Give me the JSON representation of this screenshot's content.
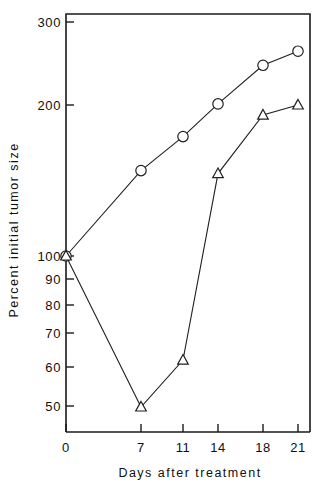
{
  "chart_data": {
    "type": "line",
    "title": "",
    "xlabel": "Days after treatment",
    "ylabel": "Percent initial tumor size",
    "yscale": "log",
    "ylim": [
      45,
      320
    ],
    "xlim": [
      0,
      22.5
    ],
    "grid": false,
    "legend": "none",
    "x": [
      0,
      7,
      11,
      14,
      18,
      21
    ],
    "xtick_labels": [
      "0",
      "7",
      "11",
      "14",
      "18",
      "21"
    ],
    "ytick_labels": [
      "50",
      "60",
      "70",
      "80",
      "90",
      "100",
      "200",
      "300"
    ],
    "ytick_values": [
      50,
      60,
      70,
      80,
      90,
      100,
      200,
      300
    ],
    "series": [
      {
        "name": "open-circle-series",
        "marker": "circle",
        "values": [
          100,
          148,
          173,
          201,
          240,
          256
        ]
      },
      {
        "name": "open-triangle-series",
        "marker": "triangle",
        "values": [
          100,
          50,
          62,
          146,
          191,
          200
        ]
      }
    ]
  },
  "axes": {
    "y_title": "Percent initial tumor size",
    "x_title": "Days after treatment"
  }
}
